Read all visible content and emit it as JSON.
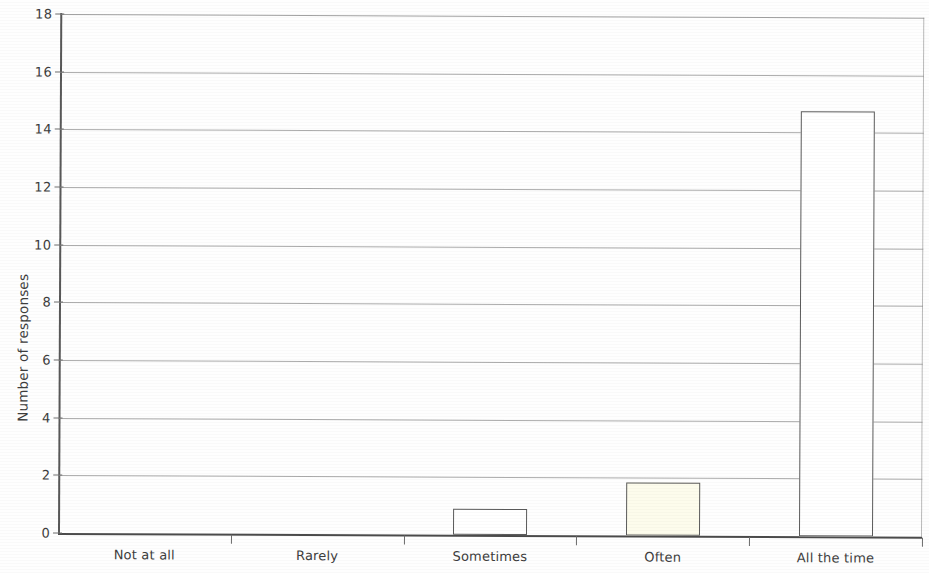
{
  "chart_data": {
    "type": "bar",
    "title": "",
    "subtitle": "",
    "xlabel": "",
    "ylabel": "Number of responses",
    "categories": [
      "Not at all",
      "Rarely",
      "Sometimes",
      "Often",
      "All the time"
    ],
    "values": [
      0,
      0,
      0.9,
      1.85,
      14.75
    ],
    "series": [
      {
        "name": "Number of responses",
        "values": [
          0,
          0,
          0.9,
          1.85,
          14.75
        ]
      }
    ],
    "ylim": [
      0,
      18
    ],
    "ytick_labels": [
      "0",
      "2",
      "4",
      "6",
      "8",
      "10",
      "12",
      "14",
      "16",
      "18"
    ],
    "ytick_values": [
      0,
      2,
      4,
      6,
      8,
      10,
      12,
      14,
      16,
      18
    ],
    "grid": "horizontal",
    "legend": "none",
    "bar_colors": [
      "#ffffff",
      "#ffffff",
      "#ffffff",
      "#fdfcec",
      "#ffffff"
    ],
    "bar_edge_color": "#5b5b5b",
    "background_color": "#fefefe",
    "gridline_color": "#8b8b8b",
    "axis_color": "#585858"
  }
}
